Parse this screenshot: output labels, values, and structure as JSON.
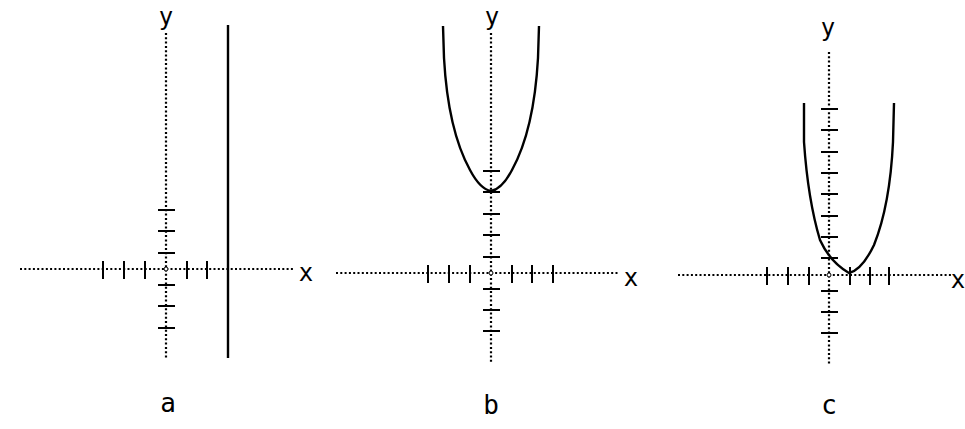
{
  "panels": [
    {
      "id": "a",
      "caption": "a",
      "x_axis_label": "x",
      "y_axis_label": "y",
      "graph": "vertical line x = 3"
    },
    {
      "id": "b",
      "caption": "b",
      "x_axis_label": "x",
      "y_axis_label": "y",
      "graph": "parabola with vertex at (0, 4)"
    },
    {
      "id": "c",
      "caption": "c",
      "x_axis_label": "x",
      "y_axis_label": "y",
      "graph": "parabola with vertex at (1, 0), y-intercept 1"
    }
  ],
  "colors": {
    "ink": "#000000",
    "background": "#ffffff"
  }
}
